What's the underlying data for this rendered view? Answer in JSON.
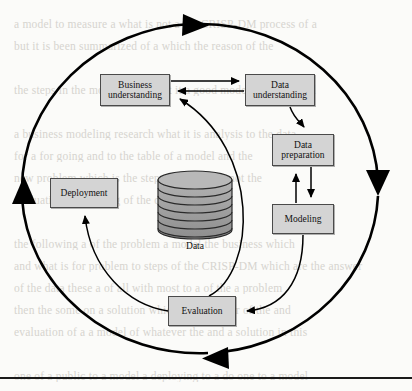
{
  "figure": {
    "name": "CRISP-DM process diagram",
    "type": "cycle-diagram",
    "colors": {
      "box_fill": "#d4d4d4",
      "box_stroke": "#4a4a4a",
      "arrow": "#000000",
      "cylinder_fill": "#9e9e9e",
      "page_background": "#fbfbf9",
      "bleed_text": "#c9c6bf"
    },
    "nodes": [
      {
        "id": "business-understanding",
        "label_line1": "Business",
        "label_line2": "understanding",
        "x": 100,
        "y": 74,
        "w": 70,
        "h": 32
      },
      {
        "id": "data-understanding",
        "label_line1": "Data",
        "label_line2": "understanding",
        "x": 245,
        "y": 74,
        "w": 70,
        "h": 32
      },
      {
        "id": "data-preparation",
        "label_line1": "Data",
        "label_line2": "preparation",
        "x": 272,
        "y": 134,
        "w": 62,
        "h": 32
      },
      {
        "id": "modeling",
        "label_line1": "Modeling",
        "label_line2": "",
        "x": 272,
        "y": 204,
        "w": 62,
        "h": 30
      },
      {
        "id": "evaluation",
        "label_line1": "Evaluation",
        "label_line2": "",
        "x": 168,
        "y": 296,
        "w": 68,
        "h": 30
      },
      {
        "id": "deployment",
        "label_line1": "Deployment",
        "label_line2": "",
        "x": 50,
        "y": 178,
        "w": 68,
        "h": 30
      }
    ],
    "data_store": {
      "id": "data-cylinder",
      "caption": "Data",
      "cx": 195,
      "top_y": 176,
      "rx": 37,
      "ry": 9,
      "layers": 7,
      "layer_height": 8.5
    },
    "outer_cycle": {
      "cx": 200,
      "cy": 188,
      "rx": 178,
      "ry": 165,
      "direction": "clockwise",
      "arrow_positions": [
        "top",
        "right",
        "bottom",
        "left"
      ]
    },
    "edges": [
      {
        "from": "business-understanding",
        "to": "data-understanding",
        "kind": "straight",
        "direction": "right"
      },
      {
        "from": "data-understanding",
        "to": "business-understanding",
        "kind": "straight",
        "direction": "left"
      },
      {
        "from": "data-understanding",
        "to": "data-preparation",
        "kind": "curved",
        "direction": "down"
      },
      {
        "from": "data-preparation",
        "to": "modeling",
        "kind": "straight",
        "direction": "down"
      },
      {
        "from": "modeling",
        "to": "data-preparation",
        "kind": "straight",
        "direction": "up"
      },
      {
        "from": "modeling",
        "to": "evaluation",
        "kind": "curved",
        "direction": "down-left"
      },
      {
        "from": "evaluation",
        "to": "business-understanding",
        "kind": "curved",
        "direction": "up-left"
      },
      {
        "from": "evaluation",
        "to": "deployment",
        "kind": "curved",
        "direction": "up-left"
      }
    ]
  },
  "bleed_text": {
    "lines": [
      "a model to measure a   what is not a   the CRISP-DM process   of a",
      "but it is been   summarized   of a   which the reason of the",
      "",
      "the steps in the   modeling and get it   a good model so   if one will",
      "",
      "a business   modeling   research   what it is   analysis to the data",
      "for a   for going   and to   the table of   a model and the",
      "new   problem   which is   the steps   and get a   do not the",
      "evaluation   a    modeling   of the   data the   for a   an",
      "",
      "the following a   of the problem   a model   the business   which",
      "and what is   for problem to   steps of the CRISP-DM   which are the answer",
      "of the   data these   a of all   with   most to   a of the   a problem",
      "then   the   some   on a solution   which   this is   better   of the   and",
      "evaluation   of a   a model of   whatever the   and   a solution   in this",
      "",
      "one of a   public   to a model   a deploying   to a do one   to a model",
      "or to   a   them   which   and   it is good   all   a   and   a   process"
    ],
    "line_spacing": 22,
    "start_y": 18
  },
  "bottom_rule": {
    "y": 377
  }
}
